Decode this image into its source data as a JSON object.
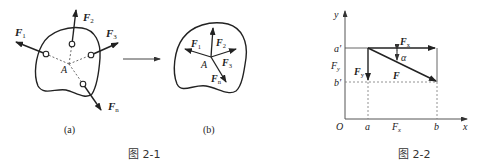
{
  "figure_2_1": {
    "caption": "图 2-1",
    "subfig_a": {
      "label": "(a)",
      "point": "A",
      "forces": [
        {
          "name": "F",
          "sub": "1"
        },
        {
          "name": "F",
          "sub": "2"
        },
        {
          "name": "F",
          "sub": "3"
        },
        {
          "name": "F",
          "sub": "n"
        }
      ]
    },
    "subfig_b": {
      "label": "(b)",
      "point": "A",
      "forces": [
        {
          "name": "F",
          "sub": "1"
        },
        {
          "name": "F",
          "sub": "2"
        },
        {
          "name": "F",
          "sub": "3"
        },
        {
          "name": "F",
          "sub": "n"
        }
      ]
    }
  },
  "figure_2_2": {
    "caption": "图 2-2",
    "axes": {
      "x": "x",
      "y": "y",
      "origin": "O"
    },
    "x_marks": [
      "a",
      "b"
    ],
    "y_marks": [
      "a′",
      "b′"
    ],
    "projection_x_label": {
      "name": "F",
      "sub": "x"
    },
    "projection_y_label": {
      "name": "F",
      "sub": "y"
    },
    "force": {
      "name": "F"
    },
    "component_x": {
      "name": "F",
      "sub": "x"
    },
    "component_y": {
      "name": "F",
      "sub": "y"
    },
    "angle": "α"
  }
}
